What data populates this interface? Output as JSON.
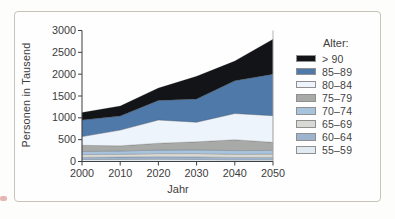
{
  "figure": {
    "legend_title": "Alter:"
  },
  "chart_data": {
    "type": "area",
    "stacked": true,
    "title": "",
    "xlabel": "Jahr",
    "ylabel": "Personen in Tausend",
    "x": [
      2000,
      2010,
      2020,
      2030,
      2040,
      2050
    ],
    "ylim": [
      0,
      3000
    ],
    "yticks": [
      0,
      500,
      1000,
      1500,
      2000,
      2500,
      3000
    ],
    "grid": false,
    "legend_title": "Alter:",
    "legend_position": "right",
    "legend_order": "top-is-oldest",
    "series": [
      {
        "name": "55–59",
        "color": "#dfeaf3",
        "values": [
          45,
          45,
          50,
          45,
          40,
          40
        ]
      },
      {
        "name": "60–64",
        "color": "#9cb4cf",
        "values": [
          50,
          55,
          60,
          60,
          55,
          55
        ]
      },
      {
        "name": "65–69",
        "color": "#d8d9d5",
        "values": [
          65,
          65,
          70,
          75,
          70,
          75
        ]
      },
      {
        "name": "70–74",
        "color": "#a8c3de",
        "values": [
          70,
          75,
          80,
          85,
          85,
          85
        ]
      },
      {
        "name": "75–79",
        "color": "#a8aaa7",
        "values": [
          140,
          120,
          160,
          185,
          250,
          185
        ]
      },
      {
        "name": "80–84",
        "color": "#eef4fb",
        "values": [
          200,
          360,
          530,
          450,
          600,
          610
        ]
      },
      {
        "name": "85–89",
        "color": "#4e79a8",
        "values": [
          380,
          320,
          450,
          530,
          750,
          950
        ]
      },
      {
        "name": "> 90",
        "color": "#131417",
        "values": [
          170,
          230,
          280,
          520,
          450,
          800
        ]
      }
    ],
    "totals": [
      1120,
      1270,
      1680,
      1950,
      2300,
      2800
    ],
    "axis_color": "#3f3f3f",
    "right_border_color": "#ababab"
  }
}
